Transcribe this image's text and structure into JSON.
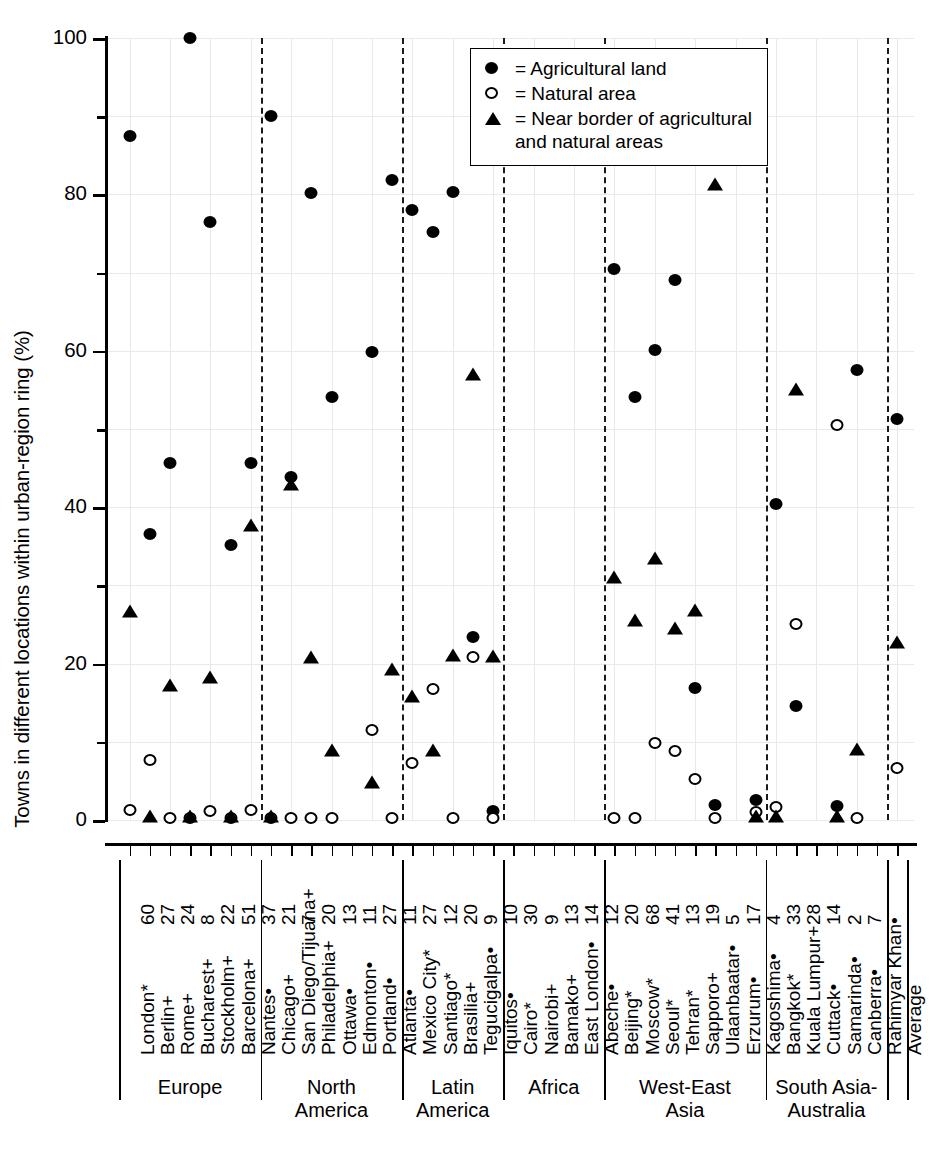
{
  "chart_data": {
    "type": "scatter",
    "title": "",
    "ylabel": "Towns in different locations within urban-region ring (%)",
    "xlabel": "",
    "ylim": [
      0,
      100
    ],
    "ytick_labels": [
      "0",
      "20",
      "40",
      "60",
      "80",
      "100"
    ],
    "ytick_values": [
      0,
      20,
      40,
      60,
      80,
      100
    ],
    "yminor_values": [
      10,
      30,
      50,
      70,
      90
    ],
    "grid": "light dotted both axes",
    "legend_position": "top-right inside plot",
    "legend": [
      {
        "symbol": "filled-circle",
        "label": "= Agricultural land"
      },
      {
        "symbol": "open-circle",
        "label": "= Natural area"
      },
      {
        "symbol": "filled-triangle",
        "label": "= Near border of agricultural and natural areas"
      }
    ],
    "series": [
      {
        "name": "Agricultural land",
        "symbol": "filled-circle"
      },
      {
        "name": "Natural area",
        "symbol": "open-circle"
      },
      {
        "name": "Near border of agricultural and natural areas",
        "symbol": "filled-triangle"
      }
    ],
    "regions": [
      {
        "label": "Europe",
        "count": 7
      },
      {
        "label": "North\nAmerica",
        "count": 7
      },
      {
        "label": "Latin\nAmerica",
        "count": 5
      },
      {
        "label": "Africa",
        "count": 5
      },
      {
        "label": "West-East\nAsia",
        "count": 8
      },
      {
        "label": "South Asia-\nAustralia",
        "count": 6
      },
      {
        "label": "",
        "count": 1
      }
    ],
    "points": [
      {
        "city": "London*",
        "n": "60",
        "agricultural": 87.5,
        "natural": 1.3,
        "border": 26.2
      },
      {
        "city": "Berlin+",
        "n": "27",
        "agricultural": 36.6,
        "natural": 7.7,
        "border": 0.0
      },
      {
        "city": "Rome+",
        "n": "24",
        "agricultural": 45.7,
        "natural": 0.2,
        "border": 16.8
      },
      {
        "city": "Bucharest+",
        "n": "8",
        "agricultural": 100.0,
        "natural": 0.3,
        "border": 0.0
      },
      {
        "city": "Stockholm+",
        "n": "22",
        "agricultural": 76.5,
        "natural": 1.2,
        "border": 17.8
      },
      {
        "city": "Barcelona+",
        "n": "51",
        "agricultural": 35.2,
        "natural": 0.3,
        "border": 0.0
      },
      {
        "city": "Nantes•",
        "n": "37",
        "agricultural": 45.7,
        "natural": 1.3,
        "border": 37.2
      },
      {
        "city": "Chicago+",
        "n": "21",
        "agricultural": 90.0,
        "natural": 0.2,
        "border": 0.0
      },
      {
        "city": "San Diego/Tijuana+",
        "n": "7",
        "agricultural": 43.9,
        "natural": 0.2,
        "border": 42.4
      },
      {
        "city": "Philadelphia+",
        "n": "20",
        "agricultural": 80.2,
        "natural": 0.2,
        "border": 20.3
      },
      {
        "city": "Ottawa•",
        "n": "13",
        "agricultural": 54.1,
        "natural": 0.3,
        "border": 8.4
      },
      {
        "city": "Edmonton•",
        "n": "11",
        "agricultural": null,
        "natural": null,
        "border": null
      },
      {
        "city": "Portland•",
        "n": "27",
        "agricultural": 59.8,
        "natural": 11.5,
        "border": 4.3
      },
      {
        "city": "Atlanta•",
        "n": "11",
        "agricultural": 81.8,
        "natural": 0.3,
        "border": 18.8
      },
      {
        "city": "Mexico City*",
        "n": "27",
        "agricultural": 78.0,
        "natural": 7.3,
        "border": 15.3
      },
      {
        "city": "Santiago*",
        "n": "12",
        "agricultural": 75.2,
        "natural": 16.8,
        "border": 8.5
      },
      {
        "city": "Brasilia+",
        "n": "20",
        "agricultural": 80.3,
        "natural": 0.3,
        "border": 20.6
      },
      {
        "city": "Tegucigalpa•",
        "n": "9",
        "agricultural": 23.4,
        "natural": 20.9,
        "border": 56.5
      },
      {
        "city": "Iquitos•",
        "n": "10",
        "agricultural": 1.1,
        "natural": 0.2,
        "border": 20.5
      },
      {
        "city": "Cairo*",
        "n": "30",
        "agricultural": null,
        "natural": null,
        "border": null
      },
      {
        "city": "Nairobi+",
        "n": "9",
        "agricultural": null,
        "natural": null,
        "border": null
      },
      {
        "city": "Bamako+",
        "n": "13",
        "agricultural": null,
        "natural": null,
        "border": null
      },
      {
        "city": "East London•",
        "n": "14",
        "agricultural": null,
        "natural": null,
        "border": null
      },
      {
        "city": "Abeche•",
        "n": "12",
        "agricultural": null,
        "natural": null,
        "border": null
      },
      {
        "city": "Beijing*",
        "n": "20",
        "agricultural": 70.4,
        "natural": 0.3,
        "border": 30.6
      },
      {
        "city": "Moscow*",
        "n": "68",
        "agricultural": 54.1,
        "natural": 0.3,
        "border": 25.1
      },
      {
        "city": "Seoul*",
        "n": "41",
        "agricultural": 60.1,
        "natural": 9.9,
        "border": 33.0
      },
      {
        "city": "Tehran*",
        "n": "13",
        "agricultural": 69.1,
        "natural": 8.8,
        "border": 24.0
      },
      {
        "city": "Sapporo+",
        "n": "19",
        "agricultural": 16.9,
        "natural": 5.2,
        "border": 26.4
      },
      {
        "city": "Ulaanbaatar•",
        "n": "5",
        "agricultural": 1.9,
        "natural": 0.2,
        "border": 80.8
      },
      {
        "city": "Erzurum•",
        "n": "17",
        "agricultural": null,
        "natural": null,
        "border": null
      },
      {
        "city": "Kagoshima•",
        "n": "4",
        "agricultural": 2.6,
        "natural": 1.0,
        "border": 0.0
      },
      {
        "city": "Bangkok*",
        "n": "33",
        "agricultural": 40.4,
        "natural": 1.6,
        "border": 0.0
      },
      {
        "city": "Kuala Lumpur+",
        "n": "28",
        "agricultural": 14.6,
        "natural": 25.1,
        "border": 54.6
      },
      {
        "city": "Cuttack•",
        "n": "14",
        "agricultural": null,
        "natural": null,
        "border": null
      },
      {
        "city": "Samarinda•",
        "n": "2",
        "agricultural": 1.8,
        "natural": 50.5,
        "border": 0.0
      },
      {
        "city": "Canberra•",
        "n": "7",
        "agricultural": 57.5,
        "natural": 0.3,
        "border": 8.6
      },
      {
        "city": "Rahimyar Khan•",
        "n": "",
        "agricultural": null,
        "natural": null,
        "border": null
      },
      {
        "city": "Average",
        "n": "",
        "agricultural": 51.3,
        "natural": 6.6,
        "border": 22.3
      }
    ]
  }
}
